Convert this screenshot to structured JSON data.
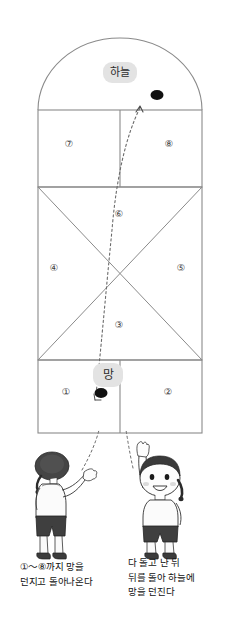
{
  "diagram": {
    "title_alt": "Korean hopscotch (sabangchigi) court diagram",
    "zones": {
      "sky": {
        "label": "하늘"
      },
      "mang": {
        "label": "망"
      }
    },
    "cells": [
      {
        "id": "cell-1",
        "label": "①",
        "x": 66,
        "y": 392
      },
      {
        "id": "cell-2",
        "label": "②",
        "x": 168,
        "y": 392
      },
      {
        "id": "cell-3",
        "label": "③",
        "x": 119,
        "y": 325
      },
      {
        "id": "cell-4",
        "label": "④",
        "x": 54,
        "y": 268
      },
      {
        "id": "cell-5",
        "label": "⑤",
        "x": 181,
        "y": 268
      },
      {
        "id": "cell-6",
        "label": "⑥",
        "x": 119,
        "y": 214
      },
      {
        "id": "cell-7",
        "label": "⑦",
        "x": 69,
        "y": 144
      },
      {
        "id": "cell-8",
        "label": "⑧",
        "x": 169,
        "y": 144
      }
    ],
    "stone": {
      "name": "mang-stone",
      "color": "#111111"
    },
    "throw_marker_sky": {
      "name": "stone-in-sky",
      "color": "#111111"
    }
  },
  "captions": {
    "left": "①～⑧까지 망을\n던지고 돌아나온다",
    "right": "다 돌고 난 뒤\n뒤를 돌아 하늘에\n망을 던진다"
  },
  "figures": [
    {
      "name": "child-throwing-left",
      "description": "girl throwing stone"
    },
    {
      "name": "child-raising-arm-right",
      "description": "girl with arm raised"
    }
  ],
  "colors": {
    "line": "#808080",
    "label_bg": "#e3e3e3",
    "ink": "#111111",
    "dash": "#6b6b6b"
  }
}
